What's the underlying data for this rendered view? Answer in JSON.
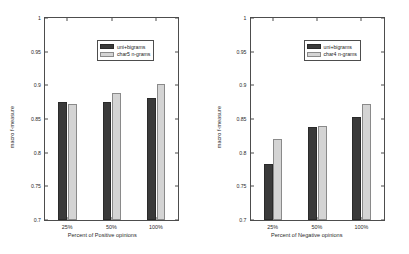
{
  "chart_data": [
    {
      "type": "bar",
      "title": "",
      "xlabel": "Percent of Positive opinions",
      "ylabel": "macro f-measure",
      "categories": [
        "25%",
        "50%",
        "100%"
      ],
      "ylim": [
        0.7,
        1
      ],
      "yticks": [
        "0.7",
        "0.75",
        "0.8",
        "0.85",
        "0.9",
        "0.95",
        "1"
      ],
      "grid": false,
      "legend_position": "top-left",
      "series": [
        {
          "name": "uni+bigrams",
          "color": "#3a3a3a",
          "values": [
            0.875,
            0.876,
            0.881
          ]
        },
        {
          "name": "char5 n-grams",
          "color": "#d4d4d4",
          "values": [
            0.872,
            0.888,
            0.902
          ]
        }
      ]
    },
    {
      "type": "bar",
      "title": "",
      "xlabel": "Percent of Negative opinions",
      "ylabel": "macro f-measure",
      "categories": [
        "25%",
        "50%",
        "100%"
      ],
      "ylim": [
        0.7,
        1
      ],
      "yticks": [
        "0.7",
        "0.75",
        "0.8",
        "0.85",
        "0.9",
        "0.95",
        "1"
      ],
      "grid": false,
      "legend_position": "top-left",
      "series": [
        {
          "name": "uni+bigrams",
          "color": "#3a3a3a",
          "values": [
            0.783,
            0.838,
            0.853
          ]
        },
        {
          "name": "char4 n-grams",
          "color": "#d4d4d4",
          "values": [
            0.821,
            0.84,
            0.872
          ]
        }
      ]
    }
  ]
}
